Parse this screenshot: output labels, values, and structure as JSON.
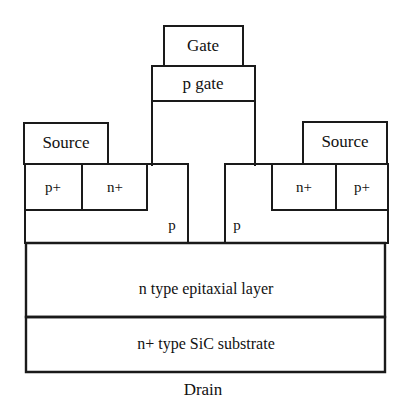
{
  "figure": {
    "name": "sic-mosfet-cross-section",
    "background_color": "#ffffff",
    "line_color": "#1a1a1a",
    "text_color": "#111111"
  },
  "gate_stack": {
    "gate_contact_label": "Gate",
    "p_gate_label": "p gate"
  },
  "left_side": {
    "source_label": "Source",
    "p_plus_label": "p+",
    "n_plus_label": "n+",
    "p_well_label": "p"
  },
  "right_side": {
    "source_label": "Source",
    "n_plus_label": "n+",
    "p_plus_label": "p+",
    "p_well_label": "p"
  },
  "layers": {
    "epitaxial_label": "n type epitaxial layer",
    "substrate_label": "n+ type SiC substrate"
  },
  "terminals": {
    "drain_label": "Drain"
  }
}
